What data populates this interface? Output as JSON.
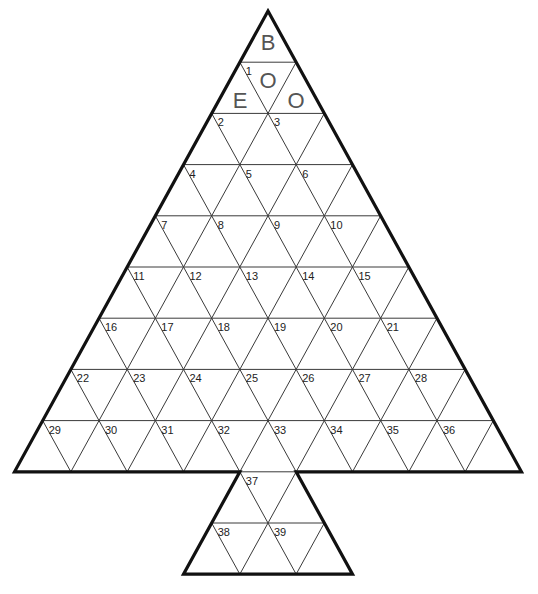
{
  "diagram": {
    "type": "triangle-grid-puzzle",
    "shape": "christmas-tree",
    "colors": {
      "outline": "#111111",
      "grid": "#3a3a3a",
      "number": "#222222",
      "letter": "#555555",
      "background": "#ffffff"
    },
    "geometry": {
      "apex": [
        268,
        11
      ],
      "row_height": 51.2,
      "cell_width": 56.33,
      "rows": 9,
      "trunk": {
        "top_y": 471.8,
        "top_left_node": 4,
        "rows": 2
      }
    },
    "letters": [
      {
        "char": "B",
        "pos": "top-up",
        "x": 268,
        "y": 50
      },
      {
        "char": "O",
        "pos": "row2-down-center",
        "x": 268,
        "y": 88
      },
      {
        "char": "E",
        "pos": "row2-up-left",
        "x": 240,
        "y": 108
      },
      {
        "char": "O",
        "pos": "row2-up-right",
        "x": 296,
        "y": 108
      }
    ],
    "numbers": [
      {
        "n": "1",
        "row": 1,
        "col": 0
      },
      {
        "n": "2",
        "row": 2,
        "col": 0
      },
      {
        "n": "3",
        "row": 2,
        "col": 1
      },
      {
        "n": "4",
        "row": 3,
        "col": 0
      },
      {
        "n": "5",
        "row": 3,
        "col": 1
      },
      {
        "n": "6",
        "row": 3,
        "col": 2
      },
      {
        "n": "7",
        "row": 4,
        "col": 0
      },
      {
        "n": "8",
        "row": 4,
        "col": 1
      },
      {
        "n": "9",
        "row": 4,
        "col": 2
      },
      {
        "n": "10",
        "row": 4,
        "col": 3
      },
      {
        "n": "11",
        "row": 5,
        "col": 0
      },
      {
        "n": "12",
        "row": 5,
        "col": 1
      },
      {
        "n": "13",
        "row": 5,
        "col": 2
      },
      {
        "n": "14",
        "row": 5,
        "col": 3
      },
      {
        "n": "15",
        "row": 5,
        "col": 4
      },
      {
        "n": "16",
        "row": 6,
        "col": 0
      },
      {
        "n": "17",
        "row": 6,
        "col": 1
      },
      {
        "n": "18",
        "row": 6,
        "col": 2
      },
      {
        "n": "19",
        "row": 6,
        "col": 3
      },
      {
        "n": "20",
        "row": 6,
        "col": 4
      },
      {
        "n": "21",
        "row": 6,
        "col": 5
      },
      {
        "n": "22",
        "row": 7,
        "col": 0
      },
      {
        "n": "23",
        "row": 7,
        "col": 1
      },
      {
        "n": "24",
        "row": 7,
        "col": 2
      },
      {
        "n": "25",
        "row": 7,
        "col": 3
      },
      {
        "n": "26",
        "row": 7,
        "col": 4
      },
      {
        "n": "27",
        "row": 7,
        "col": 5
      },
      {
        "n": "28",
        "row": 7,
        "col": 6
      },
      {
        "n": "29",
        "row": 8,
        "col": 0
      },
      {
        "n": "30",
        "row": 8,
        "col": 1
      },
      {
        "n": "31",
        "row": 8,
        "col": 2
      },
      {
        "n": "32",
        "row": 8,
        "col": 3
      },
      {
        "n": "33",
        "row": 8,
        "col": 4
      },
      {
        "n": "34",
        "row": 8,
        "col": 5
      },
      {
        "n": "35",
        "row": 8,
        "col": 6
      },
      {
        "n": "36",
        "row": 8,
        "col": 7
      },
      {
        "n": "37",
        "row": 9,
        "col": 4
      },
      {
        "n": "38",
        "row": 10,
        "col": 3.5
      },
      {
        "n": "39",
        "row": 10,
        "col": 4.5
      }
    ]
  }
}
